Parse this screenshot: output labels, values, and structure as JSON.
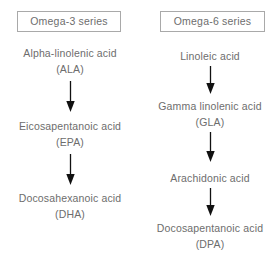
{
  "diagram": {
    "title_omega3": "Omega-3 series",
    "title_omega6": "Omega-6 series",
    "columns": [
      {
        "id": "omega-3",
        "header": "Omega-3 series",
        "nodes": [
          {
            "name": "Alpha-linolenic acid",
            "abbr": "(ALA)"
          },
          {
            "name": "Eicosapentanoic acid",
            "abbr": "(EPA)"
          },
          {
            "name": "Docosahexanoic acid",
            "abbr": "(DHA)"
          }
        ],
        "arrow_count": 2
      },
      {
        "id": "omega-6",
        "header": "Omega-6 series",
        "nodes": [
          {
            "name": "Linoleic acid",
            "abbr": ""
          },
          {
            "name": "Gamma linolenic acid",
            "abbr": "(GLA)"
          },
          {
            "name": "Arachidonic acid",
            "abbr": ""
          },
          {
            "name": "Docosapentanoic acid",
            "abbr": "(DPA)"
          }
        ],
        "arrow_count": 3
      }
    ]
  },
  "colors": {
    "text": "#6d6d6d",
    "box_border": "#a9a9a9",
    "arrow": "#111111",
    "background": "#ffffff"
  },
  "icons": {
    "arrow_down": "down-arrow-icon"
  }
}
